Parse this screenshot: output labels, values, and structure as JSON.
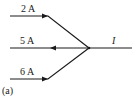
{
  "diagram": {
    "type": "circuit-node-currents",
    "panel_label": "(a)",
    "branches": [
      {
        "label": "2 A",
        "direction": "into-node",
        "position": "top-left"
      },
      {
        "label": "5 A",
        "direction": "out-of-node",
        "position": "middle-left"
      },
      {
        "label": "6 A",
        "direction": "into-node",
        "position": "bottom-left"
      },
      {
        "label": "I",
        "direction": "unknown",
        "position": "right"
      }
    ],
    "colors": {
      "line": "#1a1a1a",
      "background": "#ffffff"
    }
  }
}
